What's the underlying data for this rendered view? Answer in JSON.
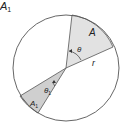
{
  "title_label": "A",
  "title_subscript": "1",
  "labels": {
    "sector_A": "A",
    "angle_theta": "θ",
    "radius": "r",
    "sector_A1": "A",
    "sector_A1_sub": "1",
    "angle_theta1": "θ",
    "angle_theta1_sub": "1"
  },
  "colors": {
    "sector_fill": "#e2e2e2",
    "sector_A1_fill": "#cfcfcf",
    "stroke": "#555555",
    "background": "#ffffff"
  },
  "geometry": {
    "center": [
      66,
      68
    ],
    "radius": 53
  }
}
